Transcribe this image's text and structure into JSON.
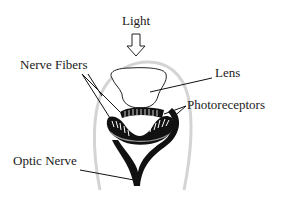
{
  "labels": {
    "light": "Light",
    "nerve_fibers": "Nerve Fibers",
    "lens": "Lens",
    "photoreceptors": "Photoreceptors",
    "optic_nerve": "Optic Nerve"
  },
  "colors": {
    "ink": "#111111",
    "outline_gray": "#cfcfcf",
    "background": "#ffffff"
  }
}
